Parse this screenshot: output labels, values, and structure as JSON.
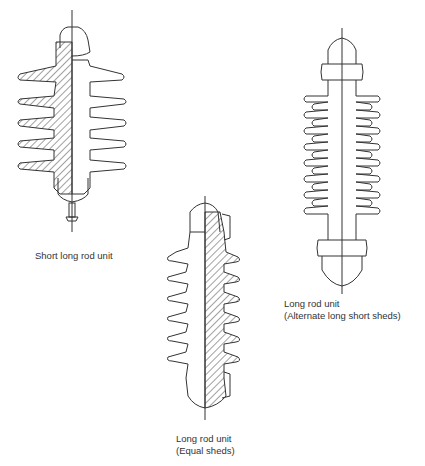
{
  "figures": [
    {
      "id": "short-long-rod",
      "caption_lines": [
        "Short long rod unit"
      ]
    },
    {
      "id": "long-rod-equal",
      "caption_lines": [
        "Long rod unit",
        "(Equal sheds)"
      ]
    },
    {
      "id": "long-rod-alternate",
      "caption_lines": [
        "Long rod unit",
        "(Alternate long short sheds)"
      ]
    }
  ],
  "colors": {
    "line": "#333333",
    "background": "#ffffff"
  }
}
